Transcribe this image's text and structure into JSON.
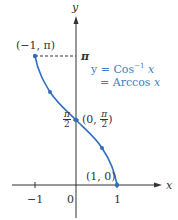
{
  "axes": {
    "x_label": "x",
    "y_label": "y",
    "x_ticks": [
      "−1",
      "0",
      "1"
    ],
    "y_ticks": [
      "π",
      "π/2"
    ]
  },
  "equation": {
    "line1": "y = Cos⁻¹ x",
    "line2": "= Arccos x"
  },
  "points": [
    {
      "label": "(−1, π)",
      "x": -1,
      "y": 3.1416
    },
    {
      "label": "(0, π/2)",
      "x": 0,
      "y": 1.5708
    },
    {
      "label": "(1, 0)",
      "x": 1,
      "y": 0
    }
  ],
  "labels": {
    "pt_top": "(−1, π)",
    "pt_mid_prefix": "(0, ",
    "pt_mid_num": "π",
    "pt_mid_den": "2",
    "pt_mid_suffix": ")",
    "pt_bottom": "(1, 0)",
    "y_pi": "π",
    "y_pi2_num": "π",
    "y_pi2_den": "2",
    "x_neg1": "−1",
    "x_zero": "0",
    "x_one": "1",
    "x_axis": "x",
    "y_axis": "y",
    "eq_line1_a": "y = Cos",
    "eq_line1_sup": "−1",
    "eq_line1_b": " x",
    "eq_line2_a": "= Arccos ",
    "eq_line2_b": "x"
  },
  "colors": {
    "curve": "#2e6fc0",
    "text_blue": "#3a7fc4",
    "axis": "#333333"
  }
}
